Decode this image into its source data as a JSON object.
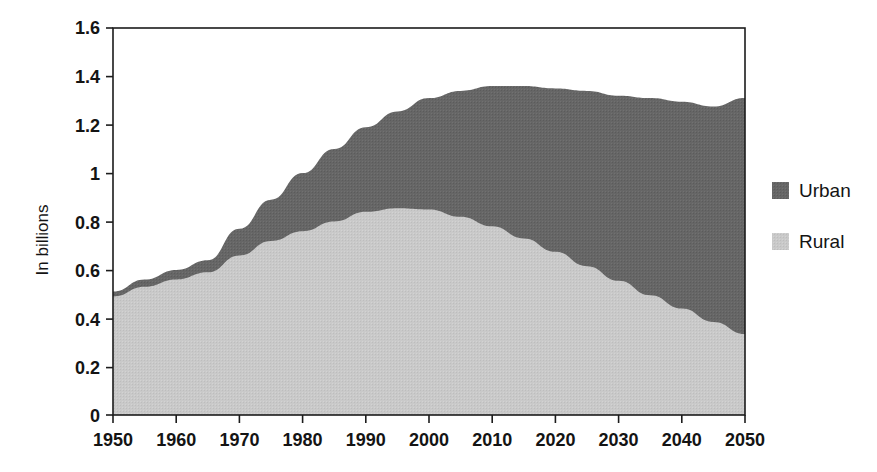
{
  "chart_data": {
    "type": "area",
    "stacked": true,
    "title": "",
    "subtitle": "",
    "xlabel": "",
    "ylabel": "In billions",
    "xlim": [
      1950,
      2050
    ],
    "ylim": [
      0,
      1.6
    ],
    "grid": true,
    "legend_position": "right",
    "x": [
      1950,
      1955,
      1960,
      1965,
      1970,
      1975,
      1980,
      1985,
      1990,
      1995,
      2000,
      2005,
      2010,
      2015,
      2020,
      2025,
      2030,
      2035,
      2040,
      2045,
      2050
    ],
    "series": [
      {
        "name": "Rural",
        "color": "#c7c7c7",
        "values": [
          0.49,
          0.53,
          0.56,
          0.59,
          0.66,
          0.72,
          0.76,
          0.8,
          0.84,
          0.855,
          0.85,
          0.82,
          0.78,
          0.73,
          0.675,
          0.615,
          0.555,
          0.495,
          0.44,
          0.385,
          0.335
        ]
      },
      {
        "name": "Urban",
        "color": "#646464",
        "values": [
          0.02,
          0.03,
          0.04,
          0.05,
          0.11,
          0.17,
          0.24,
          0.3,
          0.35,
          0.4,
          0.46,
          0.52,
          0.58,
          0.63,
          0.675,
          0.725,
          0.765,
          0.815,
          0.855,
          0.89,
          0.975
        ]
      }
    ],
    "totals": [
      0.51,
      0.56,
      0.6,
      0.64,
      0.77,
      0.89,
      1.0,
      1.1,
      1.19,
      1.255,
      1.31,
      1.34,
      1.36,
      1.36,
      1.35,
      1.34,
      1.32,
      1.31,
      1.295,
      1.275,
      1.31
    ],
    "ytick_values": [
      0,
      0.2,
      0.4,
      0.6,
      0.8,
      1.0,
      1.2,
      1.4,
      1.6
    ],
    "ytick_labels": [
      "0",
      "0.2",
      "0.4",
      "0.6",
      "0.8",
      "1",
      "1.2",
      "1.4",
      "1.6"
    ],
    "xtick_values": [
      1950,
      1960,
      1970,
      1980,
      1990,
      2000,
      2010,
      2020,
      2030,
      2040,
      2050
    ],
    "xtick_labels": [
      "1950",
      "1960",
      "1970",
      "1980",
      "1990",
      "2000",
      "2010",
      "2020",
      "2030",
      "2040",
      "2050"
    ]
  },
  "axes": {
    "y_title": "In billions",
    "ylabels": {
      "t0": "0",
      "t1": "0.2",
      "t2": "0.4",
      "t3": "0.6",
      "t4": "0.8",
      "t5": "1",
      "t6": "1.2",
      "t7": "1.4",
      "t8": "1.6"
    },
    "xlabels": {
      "t0": "1950",
      "t1": "1960",
      "t2": "1970",
      "t3": "1980",
      "t4": "1990",
      "t5": "2000",
      "t6": "2010",
      "t7": "2020",
      "t8": "2030",
      "t9": "2040",
      "t10": "2050"
    }
  },
  "legend": {
    "items": [
      {
        "label": "Urban",
        "color": "#646464"
      },
      {
        "label": "Rural",
        "color": "#c7c7c7"
      }
    ],
    "urban_label": "Urban",
    "rural_label": "Rural"
  },
  "colors": {
    "urban": "#646464",
    "rural": "#c7c7c7",
    "axis": "#1c1c1c",
    "grid": "#c9c9c9",
    "background": "#ffffff"
  }
}
